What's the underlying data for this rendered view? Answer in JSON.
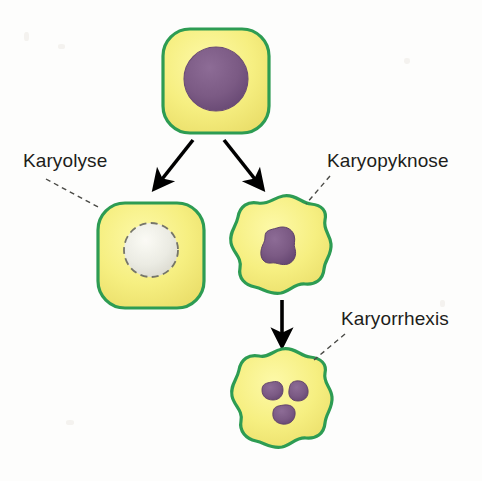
{
  "figure": {
    "background_color": "#fdfdfc",
    "labels": {
      "karyolysis": "Karyolyse",
      "karyopyknosis": "Karyopyknose",
      "karyorrhexis": "Karyorrhexis"
    },
    "palette": {
      "cytoplasm": "#f6ef81",
      "cytoplasm_shade": "#ebe06a",
      "membrane": "#2d9c53",
      "nucleus": "#7e5d87",
      "nucleus_shade": "#6b4c75",
      "lysed_nucleus": "#e8e8e6",
      "lysed_nucleus_outline": "#6f6f68",
      "arrow": "#000000",
      "leader_line": "#4a4a46",
      "text": "#1d1d1b"
    },
    "cells": [
      {
        "id": "normal-cell",
        "stage": "normal",
        "shape": "rounded-square",
        "membrane_style": "smooth",
        "nucleus_count": 1,
        "nucleus_state": "intact-round",
        "center": [
          216,
          80
        ]
      },
      {
        "id": "karyolysis-cell",
        "stage": "karyolysis",
        "shape": "rounded-square",
        "membrane_style": "smooth",
        "nucleus_count": 1,
        "nucleus_state": "faded-dissolving",
        "center": [
          151,
          256
        ]
      },
      {
        "id": "karyopyknosis-cell",
        "stage": "karyopyknosis",
        "shape": "scalloped-polygon",
        "membrane_style": "wavy",
        "nucleus_count": 1,
        "nucleus_state": "condensed-shrunken",
        "center": [
          283,
          252
        ]
      },
      {
        "id": "karyorrhexis-cell",
        "stage": "karyorrhexis",
        "shape": "scalloped-polygon",
        "membrane_style": "wavy",
        "nucleus_count": 3,
        "nucleus_state": "fragmented",
        "center": [
          282,
          402
        ]
      }
    ],
    "arrows": [
      {
        "id": "arrow-to-karyolysis",
        "from": "normal-cell",
        "to": "karyolysis-cell",
        "direction": "down-left"
      },
      {
        "id": "arrow-to-karyopyknosis",
        "from": "normal-cell",
        "to": "karyopyknosis-cell",
        "direction": "down-right"
      },
      {
        "id": "arrow-to-karyorrhexis",
        "from": "karyopyknosis-cell",
        "to": "karyorrhexis-cell",
        "direction": "down"
      }
    ],
    "leader_lines": [
      {
        "id": "leader-karyolysis",
        "label": "Karyolyse",
        "style": "dashed"
      },
      {
        "id": "leader-karyopyknosis",
        "label": "Karyopyknose",
        "style": "dashed"
      },
      {
        "id": "leader-karyorrhexis",
        "label": "Karyorrhexis",
        "style": "dashed"
      }
    ]
  }
}
